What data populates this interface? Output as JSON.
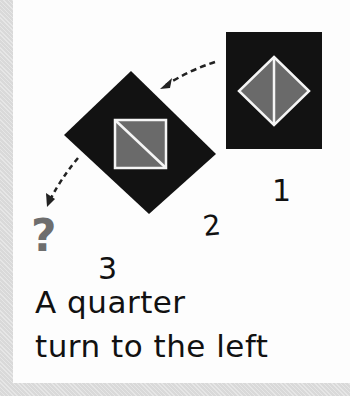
{
  "figure": {
    "colors": {
      "background": "#fdfdfd",
      "border": "#d9d9d9",
      "card": "#121212",
      "shape_fill": "#6a6a6a",
      "shape_outline": "#f5f5f5",
      "question_mark": "#6e6e6e",
      "text": "#111111"
    },
    "steps": [
      {
        "label": "1",
        "description": "black card with diamond split vertically"
      },
      {
        "label": "2",
        "description": "card rotated; square split diagonally"
      },
      {
        "label": "3",
        "description": "unknown next position",
        "symbol": "?"
      }
    ],
    "question_mark": "?",
    "caption": {
      "line1": "A quarter",
      "line2": "turn to the left"
    }
  }
}
